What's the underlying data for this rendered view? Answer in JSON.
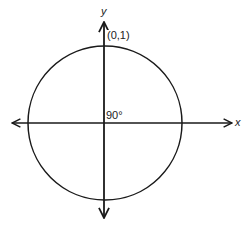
{
  "diagram": {
    "type": "unit-circle",
    "axes": {
      "x_label": "x",
      "y_label": "y"
    },
    "circle": {
      "center_px": [
        105,
        123
      ],
      "radius_px": 77
    },
    "point": {
      "label": "(0,1)",
      "position": "top of circle on y-axis"
    },
    "angle": {
      "label": "90°"
    },
    "colors": {
      "stroke": "#1a1a1a",
      "background": "#ffffff",
      "text": "#222222"
    }
  }
}
